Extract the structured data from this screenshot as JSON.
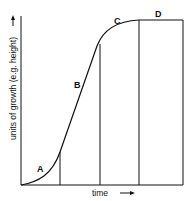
{
  "diagram": {
    "type": "growth-curve",
    "y_axis_label": "units of growth (e.g. height)",
    "x_axis_label": "time",
    "phases": [
      {
        "id": "A",
        "label": "A"
      },
      {
        "id": "B",
        "label": "B"
      },
      {
        "id": "C",
        "label": "C"
      },
      {
        "id": "D",
        "label": "D"
      }
    ],
    "colors": {
      "line": "#111111",
      "background": "#ffffff"
    }
  }
}
